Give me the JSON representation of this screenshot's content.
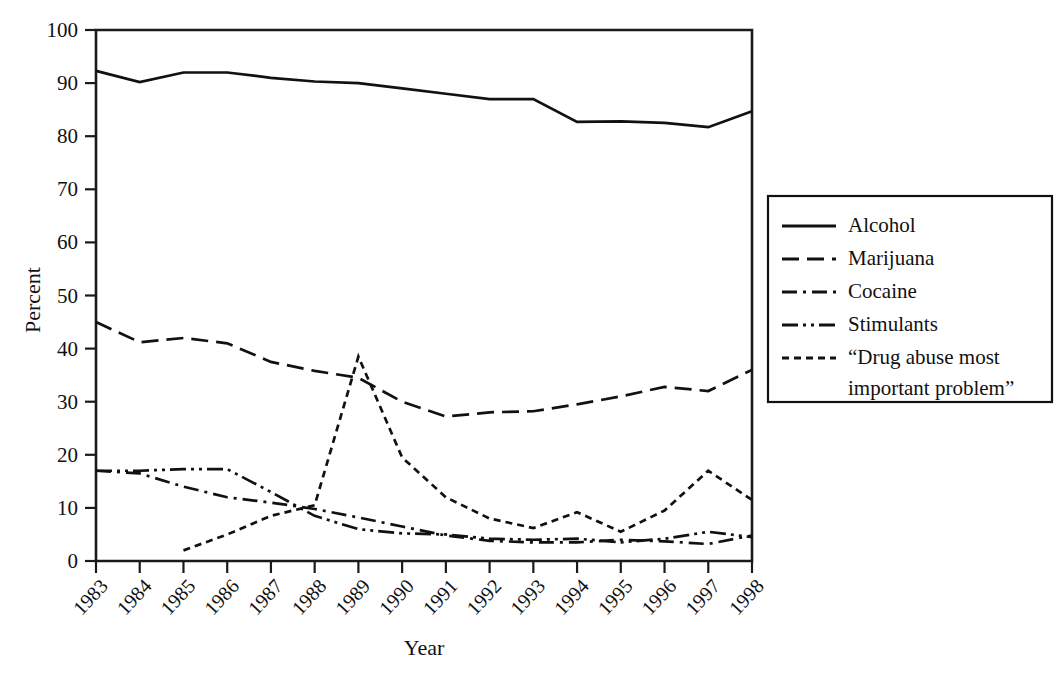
{
  "chart_data": {
    "type": "line",
    "title": "",
    "xlabel": "Year",
    "ylabel": "Percent",
    "grid": false,
    "legend_position": "right",
    "xlim": [
      1983,
      1998
    ],
    "ylim": [
      0,
      100
    ],
    "yticks": [
      0,
      10,
      20,
      30,
      40,
      50,
      60,
      70,
      80,
      90,
      100
    ],
    "categories": [
      "1983",
      "1984",
      "1985",
      "1986",
      "1987",
      "1988",
      "1989",
      "1990",
      "1991",
      "1992",
      "1993",
      "1994",
      "1995",
      "1996",
      "1997",
      "1998"
    ],
    "series": [
      {
        "name": "Alcohol",
        "dash": "solid",
        "values": [
          92.3,
          90.2,
          92.0,
          92.0,
          91.0,
          90.3,
          90.0,
          89.0,
          88.0,
          87.0,
          87.0,
          82.7,
          82.8,
          82.5,
          81.7,
          84.7
        ]
      },
      {
        "name": "Marijuana",
        "dash": "long-dash",
        "values": [
          45.0,
          41.2,
          42.0,
          41.0,
          37.5,
          35.8,
          34.5,
          30.0,
          27.2,
          28.0,
          28.2,
          29.5,
          31.0,
          32.8,
          32.0,
          36.0
        ]
      },
      {
        "name": "Cocaine",
        "dash": "dash-dot",
        "values": [
          17.0,
          16.5,
          14.0,
          12.0,
          11.0,
          9.8,
          8.2,
          6.5,
          4.8,
          3.8,
          3.5,
          3.5,
          4.0,
          3.7,
          3.2,
          4.8
        ]
      },
      {
        "name": "Stimulants",
        "dash": "dash-dot-dot",
        "values": [
          17.0,
          17.0,
          17.3,
          17.3,
          13.0,
          8.5,
          6.0,
          5.2,
          5.0,
          4.2,
          4.0,
          4.2,
          3.5,
          4.2,
          5.5,
          4.5
        ]
      },
      {
        "name": "“Drug abuse most important problem”",
        "dash": "short-dash",
        "values": [
          null,
          null,
          2.0,
          5.0,
          8.5,
          10.5,
          38.5,
          19.5,
          12.0,
          8.0,
          6.2,
          9.2,
          5.5,
          9.5,
          17.0,
          11.5
        ]
      }
    ]
  },
  "legend": {
    "entries": [
      {
        "label": "Alcohol",
        "dash": "solid"
      },
      {
        "label": "Marijuana",
        "dash": "long-dash"
      },
      {
        "label": "Cocaine",
        "dash": "dash-dot"
      },
      {
        "label": "Stimulants",
        "dash": "dash-dot-dot"
      },
      {
        "label_line1": "“Drug abuse most",
        "label_line2": "important problem”",
        "dash": "short-dash"
      }
    ]
  },
  "colors": {
    "ink": "#111111",
    "background": "#ffffff"
  }
}
